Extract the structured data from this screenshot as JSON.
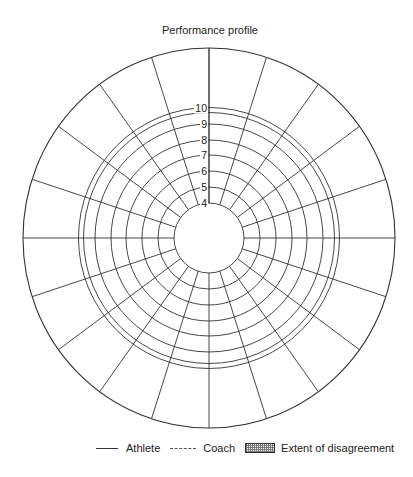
{
  "title": "Performance profile",
  "chart": {
    "center": [
      209,
      238
    ],
    "outer_radius": [
      186,
      190
    ],
    "spoke_count": 20,
    "rings": [
      {
        "label": "4",
        "radius": 35
      },
      {
        "label": "5",
        "radius": 51
      },
      {
        "label": "6",
        "radius": 67
      },
      {
        "label": "7",
        "radius": 83
      },
      {
        "label": "8",
        "radius": 98
      },
      {
        "label": "9",
        "radius": 114
      },
      {
        "label": "10",
        "radius": 130.5
      },
      {
        "label": "",
        "radius": 125.5
      }
    ],
    "line_color": "#333333"
  },
  "chart_data": {
    "type": "radar",
    "title": "Performance profile",
    "segments": 20,
    "scale_ticks": [
      "4",
      "5",
      "6",
      "7",
      "8",
      "9",
      "10"
    ],
    "scale_range": [
      4,
      10
    ],
    "series": [
      {
        "name": "Athlete",
        "style": "solid",
        "values": []
      },
      {
        "name": "Coach",
        "style": "dashed",
        "values": []
      }
    ],
    "shaded_area": "Extent of disagreement",
    "legend_position": "bottom",
    "grid": true
  },
  "legend": {
    "items": [
      {
        "label": "Athlete",
        "style": "solid"
      },
      {
        "label": "Coach",
        "style": "dashed"
      },
      {
        "label": "Extent of disagreement",
        "style": "hatched"
      }
    ]
  }
}
